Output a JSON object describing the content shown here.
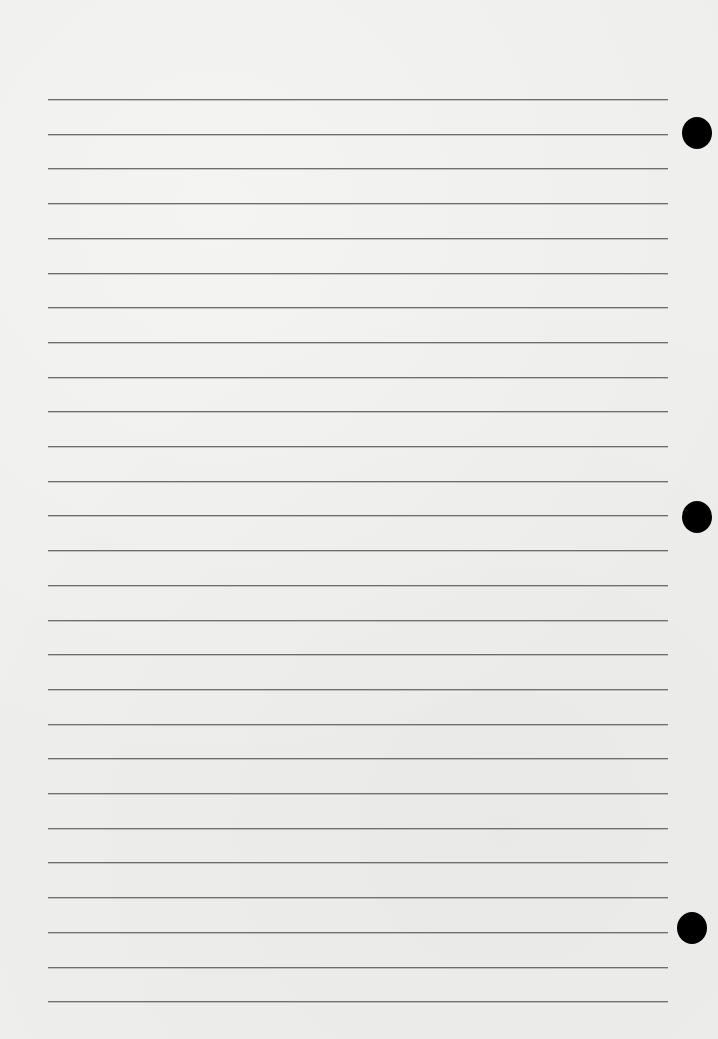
{
  "page": {
    "type": "ruled-notebook-sheet",
    "background_color": "#eeeeec",
    "rule_color": "#6e6e6e",
    "hole_color": "#000000"
  },
  "rules": {
    "count": 27,
    "first_y": 99,
    "spacing": 34.7,
    "left": 48,
    "width": 620
  },
  "punch_holes": [
    {
      "cx": 697,
      "cy": 133
    },
    {
      "cx": 697,
      "cy": 517
    },
    {
      "cx": 692,
      "cy": 928
    }
  ]
}
